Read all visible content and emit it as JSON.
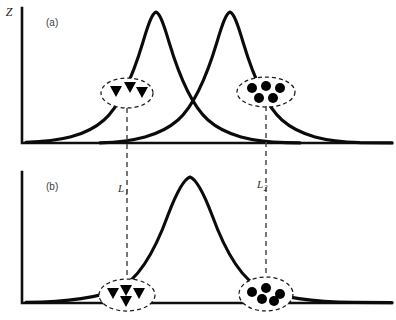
{
  "figure": {
    "width": 396,
    "height": 320,
    "background_color": "#ffffff",
    "curve_color": "#0b0b0b",
    "axis_color": "#0f0f0f",
    "dashed_color": "#4a4a4a",
    "marker_color": "#000000"
  },
  "panels": [
    {
      "id": "panel-a",
      "label": "(a)",
      "label_x": 46,
      "label_y": 26,
      "y_axis_label": "Z",
      "y_axis_label_x": 9,
      "y_axis_label_y": 16,
      "axis": {
        "origin_x": 22,
        "baseline_y": 143,
        "top_y": 8,
        "right_x": 392
      },
      "curves": [
        {
          "name": "left-distribution",
          "peak_x": 156,
          "peak_y": 12,
          "sigma": 44,
          "start_x": 26,
          "end_x": 300
        },
        {
          "name": "right-distribution",
          "peak_x": 230,
          "peak_y": 12,
          "sigma": 44,
          "start_x": 100,
          "end_x": 392
        }
      ],
      "clusters": [
        {
          "name": "triangle-cluster",
          "marker_shape": "triangle-down",
          "marker_count": 3,
          "center_x": 127,
          "center_y": 93,
          "radius_x": 26,
          "radius_y": 15
        },
        {
          "name": "circle-cluster",
          "marker_shape": "circle",
          "marker_count": 5,
          "center_x": 266,
          "center_y": 92,
          "radius_x": 29,
          "radius_y": 15
        }
      ]
    },
    {
      "id": "panel-b",
      "label": "(b)",
      "label_x": 46,
      "label_y": 190,
      "y_axis_label": "",
      "axis": {
        "origin_x": 22,
        "baseline_y": 303,
        "top_y": 172,
        "right_x": 392
      },
      "curves": [
        {
          "name": "merged-distribution",
          "peak_x": 190,
          "peak_y": 177,
          "sigma": 58,
          "start_x": 26,
          "end_x": 392
        }
      ],
      "clusters": [
        {
          "name": "triangle-cluster",
          "marker_shape": "triangle-down",
          "marker_count": 4,
          "center_x": 127,
          "center_y": 295,
          "radius_x": 28,
          "radius_y": 16
        },
        {
          "name": "circle-cluster",
          "marker_shape": "circle",
          "marker_count": 5,
          "center_x": 266,
          "center_y": 294,
          "radius_x": 27,
          "radius_y": 17
        }
      ]
    }
  ],
  "projections": [
    {
      "name": "projection-l1",
      "label_base": "L",
      "label_sub": "1",
      "x": 127,
      "y_start": 108,
      "y_end": 292,
      "label_x": 118,
      "label_y": 192
    },
    {
      "name": "projection-l2",
      "label_base": "L",
      "label_sub": "2",
      "x": 266,
      "y_start": 106,
      "y_end": 288,
      "label_x": 257,
      "label_y": 188
    }
  ]
}
